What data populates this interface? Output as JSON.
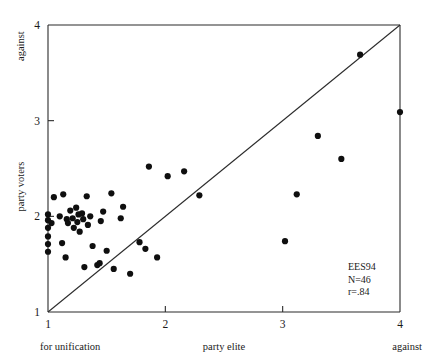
{
  "chart_data": {
    "type": "scatter",
    "title": "",
    "xlabel": "party elite",
    "ylabel": "party voters",
    "xlim": [
      1,
      4
    ],
    "ylim": [
      1,
      4
    ],
    "xticks": [
      "1",
      "2",
      "3",
      "4"
    ],
    "yticks": [
      "1",
      "2",
      "3",
      "4"
    ],
    "xtick_values": [
      1,
      2,
      3,
      4
    ],
    "ytick_values": [
      1,
      2,
      3,
      4
    ],
    "grid": false,
    "legend": "none",
    "x_axis_end_labels": {
      "left": "for unification",
      "right": "against"
    },
    "y_axis_end_labels": {
      "bottom": "1",
      "top": "against"
    },
    "reference_line": {
      "type": "diagonal-identity",
      "from": [
        1,
        1
      ],
      "to": [
        4,
        4
      ]
    },
    "annotation": {
      "lines": [
        "EES94",
        "N=46",
        "r=.84"
      ],
      "survey": "EES94",
      "n": 46,
      "r": 0.84,
      "position": "bottom-right"
    },
    "marker": {
      "shape": "circle",
      "color": "#0f0f0f",
      "size": 3.1
    },
    "points": [
      {
        "x": 1.0,
        "y": 2.02
      },
      {
        "x": 1.0,
        "y": 1.96
      },
      {
        "x": 1.0,
        "y": 1.88
      },
      {
        "x": 1.0,
        "y": 1.79
      },
      {
        "x": 1.0,
        "y": 1.71
      },
      {
        "x": 1.0,
        "y": 1.63
      },
      {
        "x": 1.03,
        "y": 1.93
      },
      {
        "x": 1.05,
        "y": 2.2
      },
      {
        "x": 1.1,
        "y": 2.0
      },
      {
        "x": 1.12,
        "y": 1.72
      },
      {
        "x": 1.13,
        "y": 2.23
      },
      {
        "x": 1.15,
        "y": 1.57
      },
      {
        "x": 1.16,
        "y": 1.97
      },
      {
        "x": 1.17,
        "y": 1.93
      },
      {
        "x": 1.19,
        "y": 2.06
      },
      {
        "x": 1.21,
        "y": 1.98
      },
      {
        "x": 1.22,
        "y": 1.88
      },
      {
        "x": 1.24,
        "y": 2.09
      },
      {
        "x": 1.25,
        "y": 1.94
      },
      {
        "x": 1.26,
        "y": 2.02
      },
      {
        "x": 1.27,
        "y": 1.84
      },
      {
        "x": 1.29,
        "y": 2.03
      },
      {
        "x": 1.3,
        "y": 1.97
      },
      {
        "x": 1.31,
        "y": 1.47
      },
      {
        "x": 1.33,
        "y": 2.21
      },
      {
        "x": 1.34,
        "y": 1.91
      },
      {
        "x": 1.36,
        "y": 2.0
      },
      {
        "x": 1.38,
        "y": 1.69
      },
      {
        "x": 1.42,
        "y": 1.49
      },
      {
        "x": 1.44,
        "y": 1.51
      },
      {
        "x": 1.45,
        "y": 1.95
      },
      {
        "x": 1.47,
        "y": 2.05
      },
      {
        "x": 1.5,
        "y": 1.64
      },
      {
        "x": 1.54,
        "y": 2.24
      },
      {
        "x": 1.56,
        "y": 1.45
      },
      {
        "x": 1.62,
        "y": 1.98
      },
      {
        "x": 1.64,
        "y": 2.1
      },
      {
        "x": 1.7,
        "y": 1.4
      },
      {
        "x": 1.78,
        "y": 1.73
      },
      {
        "x": 1.83,
        "y": 1.66
      },
      {
        "x": 1.86,
        "y": 2.52
      },
      {
        "x": 1.93,
        "y": 1.57
      },
      {
        "x": 2.02,
        "y": 2.42
      },
      {
        "x": 2.16,
        "y": 2.47
      },
      {
        "x": 2.29,
        "y": 2.22
      },
      {
        "x": 3.02,
        "y": 1.74
      },
      {
        "x": 3.12,
        "y": 2.23
      },
      {
        "x": 3.3,
        "y": 2.84
      },
      {
        "x": 3.5,
        "y": 2.6
      },
      {
        "x": 3.66,
        "y": 3.69
      },
      {
        "x": 4.0,
        "y": 3.09
      }
    ]
  }
}
